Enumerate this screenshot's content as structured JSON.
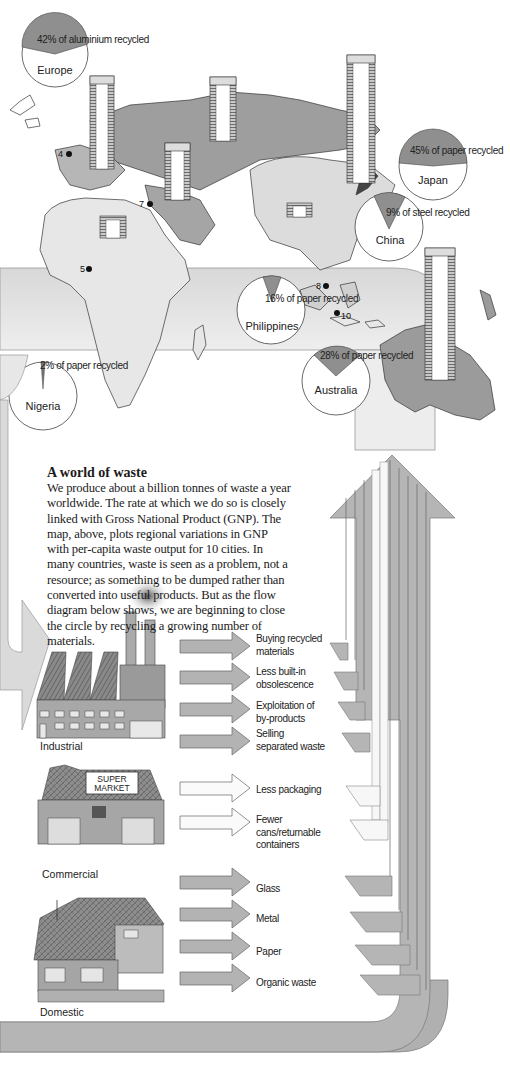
{
  "map": {
    "pies": [
      {
        "region": "Europe",
        "caption": "42% of aluminium recycled",
        "percent": 42,
        "material": "aluminium"
      },
      {
        "region": "Japan",
        "caption": "45% of paper recycled",
        "percent": 45,
        "material": "paper"
      },
      {
        "region": "China",
        "caption": "9% of steel recycled",
        "percent": 9,
        "material": "steel"
      },
      {
        "region": "Philippines",
        "caption": "16% of paper recycled",
        "percent": 16,
        "material": "paper"
      },
      {
        "region": "Nigeria",
        "caption": "2% of paper recycled",
        "percent": 2,
        "material": "paper"
      },
      {
        "region": "Australia",
        "caption": "28% of paper recycled",
        "percent": 28,
        "material": "paper"
      }
    ],
    "cities": [
      {
        "number": "4"
      },
      {
        "number": "5"
      },
      {
        "number": "7"
      },
      {
        "number": "8"
      },
      {
        "number": "10"
      }
    ],
    "gnp_stack_icon": "dollar-note-stack-icon"
  },
  "intro": {
    "title": "A world of waste",
    "body": "We produce about a billion tonnes of waste a year worldwide. The rate at which we do so is closely linked with Gross National Product (GNP). The map, above, plots regional variations in GNP with per-capita waste output for 10 cities. In many countries, waste is seen as a problem, not a resource; as something to be dumped rather than converted into useful products. But as the flow diagram below shows, we are beginning to close the circle by recycling a growing number of materials."
  },
  "flow": {
    "sources": [
      {
        "label": "Industrial",
        "icon": "factory-icon"
      },
      {
        "label": "Commercial",
        "icon": "supermarket-icon",
        "sign": "SUPER MARKET"
      },
      {
        "label": "Domestic",
        "icon": "house-icon"
      }
    ],
    "industrial_outputs": [
      {
        "label": "Buying recycled materials"
      },
      {
        "label": "Less built-in obsolescence"
      },
      {
        "label": "Exploitation of by-products"
      },
      {
        "label": "Selling separated waste"
      }
    ],
    "commercial_outputs": [
      {
        "label": "Less packaging"
      },
      {
        "label": "Fewer cans/returnable containers"
      }
    ],
    "domestic_outputs": [
      {
        "label": "Glass"
      },
      {
        "label": "Metal"
      },
      {
        "label": "Paper"
      },
      {
        "label": "Organic waste"
      }
    ]
  },
  "colors": {
    "land_dark": "#9b9b9b",
    "land_mid": "#b9b9b9",
    "land_light": "#d9d9d9",
    "arrow_fill": "#b3b3b3",
    "arrow_light": "#f2f2f2",
    "pie_slice": "#8f8f8f",
    "band": "#e6e6e6"
  }
}
